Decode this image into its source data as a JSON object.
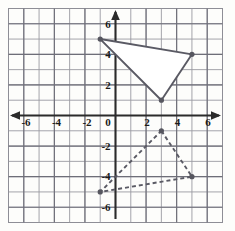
{
  "figure": {
    "kind": "coordinate-plane",
    "background_color": "#fdfdfb",
    "grid_color": "#8e8e96",
    "axis_color": "#2b2b2b",
    "width": 235,
    "height": 231
  },
  "axes": {
    "x_label_values": [
      "-6",
      "-4",
      "-2",
      "0",
      "2",
      "4",
      "6"
    ],
    "y_label_values": [
      "6",
      "4",
      "2",
      "-2",
      "-4",
      "-6"
    ],
    "origin_label": "0",
    "x_arrow_left": "arrow-left",
    "x_arrow_right": "arrow-right",
    "y_arrow_up": "arrow-up"
  },
  "chart_data": {
    "type": "scatter",
    "title": "",
    "xlabel": "",
    "ylabel": "",
    "xlim": [
      -7,
      7
    ],
    "ylim": [
      -7,
      7
    ],
    "grid": true,
    "x_ticks": [
      -6,
      -4,
      -2,
      0,
      2,
      4,
      6
    ],
    "y_ticks": [
      6,
      4,
      2,
      -2,
      -4,
      -6
    ],
    "x_tick_labels": [
      "-6",
      "-4",
      "-2",
      "0",
      "2",
      "4",
      "6"
    ],
    "y_tick_labels": [
      "6",
      "4",
      "2",
      "-2",
      "-4",
      "-6"
    ],
    "minor_gridline_step": 1,
    "legend": [],
    "series": [
      {
        "name": "preimage-triangle",
        "style": "solid",
        "fill": "#ffffff",
        "stroke": "#5a5a64",
        "vertices": [
          {
            "x": -1,
            "y": 5
          },
          {
            "x": 5,
            "y": 4
          },
          {
            "x": 3,
            "y": 1
          }
        ]
      },
      {
        "name": "image-triangle",
        "style": "dashed",
        "fill": "none",
        "stroke": "#5a5a64",
        "vertices": [
          {
            "x": 3,
            "y": -1
          },
          {
            "x": 5,
            "y": -4
          },
          {
            "x": -1,
            "y": -5
          }
        ]
      }
    ]
  }
}
